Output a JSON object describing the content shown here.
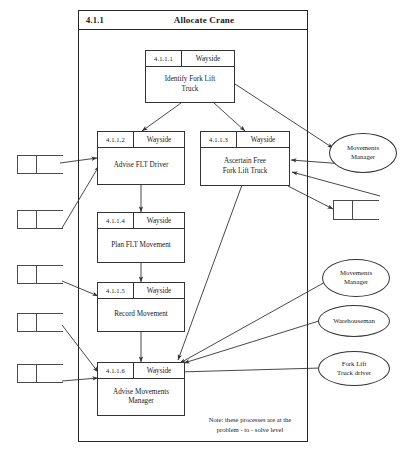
{
  "diagram": {
    "frame": {
      "id": "4.1.1",
      "title": "Allocate Crane"
    },
    "note": "Note: these processes are at the\nproblem - to - solve level",
    "note_line1": "Note: these processes are at the",
    "note_line2": "problem - to - solve level",
    "processes": [
      {
        "num": "4.1.1.1",
        "actor": "Wayside",
        "name": "Identify Fork Lift\nTruck",
        "name_line1": "Identify Fork Lift",
        "name_line2": "Truck"
      },
      {
        "num": "4.1.1.2",
        "actor": "Wayside",
        "name": "Advise FLT Driver",
        "name_line1": "Advise FLT Driver",
        "name_line2": ""
      },
      {
        "num": "4.1.1.3",
        "actor": "Wayside",
        "name": "Ascertain Free\nFork Lift Truck",
        "name_line1": "Ascertain Free",
        "name_line2": "Fork Lift Truck"
      },
      {
        "num": "4.1.1.4",
        "actor": "Wayside",
        "name": "Plan FLT Movement",
        "name_line1": "Plan FLT Movement",
        "name_line2": ""
      },
      {
        "num": "4.1.1.5",
        "actor": "Wayside",
        "name": "Record Movement",
        "name_line1": "Record Movement",
        "name_line2": ""
      },
      {
        "num": "4.1.1.6",
        "actor": "Wayside",
        "name": "Advise Movements\nManager",
        "name_line1": "Advise Movements",
        "name_line2": "Manager"
      }
    ],
    "entities": [
      {
        "label": "Movements\nManager",
        "line1": "Movements",
        "line2": "Manager"
      },
      {
        "label": "Movements\nManager",
        "line1": "Movements",
        "line2": "Manager"
      },
      {
        "label": "Warehouseman",
        "line1": "Warehouseman",
        "line2": ""
      },
      {
        "label": "Fork Lift\nTruck driver",
        "line1": "Fork Lift",
        "line2": "Truck driver"
      }
    ],
    "stores": [
      {
        "position": "left-1"
      },
      {
        "position": "left-2"
      },
      {
        "position": "left-3"
      },
      {
        "position": "left-4"
      },
      {
        "position": "left-5"
      },
      {
        "position": "right-1"
      }
    ],
    "colors": {
      "line": "#333333",
      "frame": "#262626",
      "background": "#ffffff",
      "text": "#1a1a1a"
    }
  }
}
